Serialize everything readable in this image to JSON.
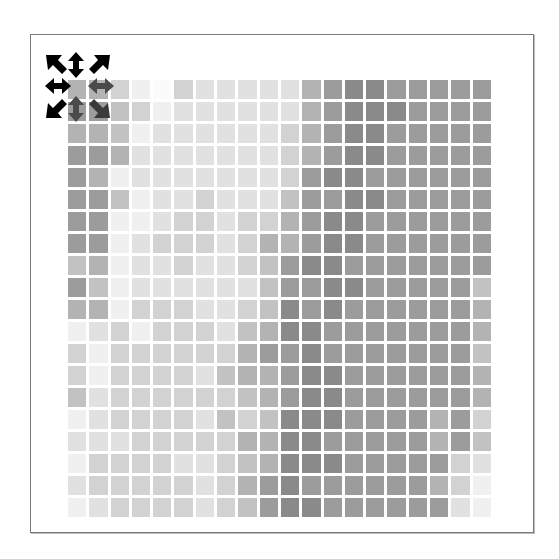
{
  "puzzle": {
    "name": "gradient-tile-grid",
    "rows": 20,
    "cols": 20,
    "selected_cell": {
      "row": 0,
      "col": 0
    },
    "shade_palette": [
      "#fbfbfb",
      "#f0f0f0",
      "#e1e1e1",
      "#d2d2d2",
      "#c2c2c2",
      "#b3b3b3",
      "#9c9c9c",
      "#8a8a8a",
      "#777777",
      "#646464"
    ],
    "grid": [
      [
        5,
        5,
        3,
        1,
        0,
        3,
        2,
        2,
        2,
        2,
        2,
        5,
        6,
        7,
        7,
        6,
        6,
        6,
        6,
        6
      ],
      [
        6,
        6,
        4,
        3,
        1,
        2,
        2,
        2,
        2,
        2,
        2,
        5,
        6,
        7,
        7,
        7,
        6,
        6,
        6,
        6
      ],
      [
        5,
        5,
        4,
        1,
        2,
        2,
        2,
        2,
        2,
        2,
        3,
        5,
        6,
        7,
        7,
        6,
        6,
        6,
        6,
        6
      ],
      [
        6,
        6,
        5,
        2,
        2,
        2,
        2,
        2,
        2,
        2,
        3,
        5,
        6,
        7,
        7,
        6,
        6,
        6,
        6,
        6
      ],
      [
        6,
        5,
        1,
        2,
        2,
        2,
        2,
        2,
        2,
        2,
        3,
        6,
        7,
        7,
        6,
        6,
        6,
        6,
        6,
        6
      ],
      [
        6,
        6,
        4,
        1,
        2,
        2,
        3,
        2,
        2,
        2,
        4,
        6,
        6,
        7,
        7,
        6,
        6,
        6,
        6,
        6
      ],
      [
        6,
        6,
        1,
        1,
        2,
        3,
        3,
        2,
        3,
        3,
        5,
        6,
        7,
        7,
        6,
        6,
        6,
        6,
        6,
        6
      ],
      [
        6,
        6,
        1,
        2,
        3,
        3,
        3,
        2,
        3,
        5,
        5,
        6,
        7,
        7,
        6,
        6,
        6,
        6,
        6,
        6
      ],
      [
        4,
        5,
        1,
        2,
        2,
        3,
        2,
        2,
        3,
        4,
        6,
        7,
        7,
        6,
        6,
        6,
        6,
        6,
        6,
        6
      ],
      [
        6,
        4,
        1,
        2,
        2,
        2,
        2,
        2,
        2,
        4,
        6,
        6,
        7,
        7,
        6,
        6,
        6,
        6,
        6,
        4
      ],
      [
        5,
        5,
        1,
        3,
        3,
        3,
        2,
        2,
        3,
        4,
        7,
        6,
        7,
        6,
        6,
        6,
        6,
        6,
        6,
        5
      ],
      [
        1,
        2,
        3,
        1,
        3,
        3,
        3,
        2,
        4,
        5,
        7,
        7,
        6,
        6,
        6,
        6,
        6,
        6,
        6,
        5
      ],
      [
        3,
        1,
        3,
        3,
        3,
        3,
        3,
        3,
        5,
        6,
        6,
        7,
        6,
        6,
        6,
        6,
        6,
        6,
        6,
        4
      ],
      [
        3,
        1,
        3,
        3,
        3,
        3,
        2,
        4,
        5,
        5,
        6,
        7,
        7,
        6,
        6,
        6,
        6,
        6,
        6,
        5
      ],
      [
        4,
        2,
        3,
        3,
        3,
        3,
        3,
        3,
        4,
        5,
        6,
        7,
        7,
        6,
        6,
        6,
        6,
        6,
        6,
        5
      ],
      [
        1,
        2,
        3,
        3,
        3,
        3,
        2,
        4,
        3,
        4,
        7,
        7,
        7,
        6,
        6,
        6,
        6,
        5,
        6,
        3
      ],
      [
        2,
        2,
        2,
        3,
        3,
        3,
        3,
        3,
        5,
        5,
        7,
        7,
        6,
        6,
        6,
        6,
        6,
        5,
        6,
        4
      ],
      [
        1,
        3,
        3,
        3,
        3,
        2,
        2,
        3,
        4,
        5,
        7,
        7,
        7,
        6,
        6,
        6,
        6,
        6,
        3,
        2
      ],
      [
        2,
        3,
        3,
        3,
        3,
        3,
        2,
        3,
        5,
        6,
        7,
        6,
        6,
        6,
        6,
        6,
        6,
        5,
        3,
        1
      ],
      [
        1,
        2,
        3,
        3,
        3,
        3,
        2,
        3,
        4,
        6,
        7,
        7,
        6,
        6,
        6,
        6,
        6,
        6,
        2,
        1
      ]
    ]
  },
  "cursor": {
    "icon": "move-cursor-8-way",
    "arrows": [
      "north-west",
      "north",
      "north-east",
      "west",
      "east",
      "south-west",
      "south",
      "south-east"
    ],
    "color_outside": "#000000",
    "color_over_tiles": "#4a4a4a"
  },
  "colors": {
    "background": "#ffffff",
    "frame_border": "#7a7a7a",
    "gap": "#ffffff"
  }
}
